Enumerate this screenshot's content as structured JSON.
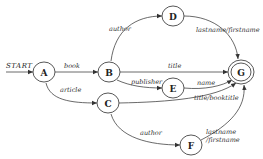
{
  "diagram": {
    "type": "finite-state-automaton",
    "start_label": "START",
    "nodes": [
      {
        "id": "A",
        "label": "A",
        "x": 44,
        "y": 72,
        "accepting": false
      },
      {
        "id": "B",
        "label": "B",
        "x": 109,
        "y": 72,
        "accepting": false
      },
      {
        "id": "C",
        "label": "C",
        "x": 108,
        "y": 103,
        "accepting": false
      },
      {
        "id": "D",
        "label": "D",
        "x": 173,
        "y": 16,
        "accepting": false
      },
      {
        "id": "E",
        "label": "E",
        "x": 173,
        "y": 88,
        "accepting": false
      },
      {
        "id": "F",
        "label": "F",
        "x": 191,
        "y": 145,
        "accepting": false
      },
      {
        "id": "G",
        "label": "G",
        "x": 241,
        "y": 72,
        "accepting": true
      }
    ],
    "edges": [
      {
        "from": "START",
        "to": "A",
        "label": ""
      },
      {
        "from": "A",
        "to": "B",
        "label": "book"
      },
      {
        "from": "A",
        "to": "C",
        "label": "article"
      },
      {
        "from": "B",
        "to": "D",
        "label": "author"
      },
      {
        "from": "B",
        "to": "G",
        "label": "title"
      },
      {
        "from": "B",
        "to": "E",
        "label": "publisher"
      },
      {
        "from": "D",
        "to": "G",
        "label": "lastname/firstname"
      },
      {
        "from": "E",
        "to": "G",
        "label": "name"
      },
      {
        "from": "C",
        "to": "G",
        "label": "title/booktitle"
      },
      {
        "from": "C",
        "to": "F",
        "label": "author"
      },
      {
        "from": "F",
        "to": "G",
        "label_line1": "lastname",
        "label_line2": "/firstname"
      }
    ]
  }
}
